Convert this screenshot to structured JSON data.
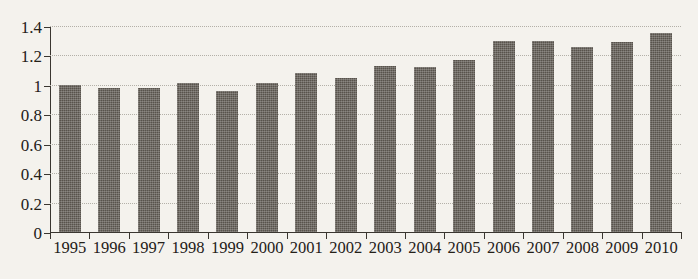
{
  "chart_data": {
    "type": "bar",
    "title": "",
    "subtitle": "",
    "xlabel": "",
    "ylabel": "",
    "categories": [
      "1995",
      "1996",
      "1997",
      "1998",
      "1999",
      "2000",
      "2001",
      "2002",
      "2003",
      "2004",
      "2005",
      "2006",
      "2007",
      "2008",
      "2009",
      "2010"
    ],
    "values": [
      1.0,
      0.98,
      0.98,
      1.01,
      0.96,
      1.01,
      1.08,
      1.05,
      1.13,
      1.12,
      1.17,
      1.3,
      1.3,
      1.26,
      1.29,
      1.35
    ],
    "series": [
      {
        "name": "",
        "values": [
          1.0,
          0.98,
          0.98,
          1.01,
          0.96,
          1.01,
          1.08,
          1.05,
          1.13,
          1.12,
          1.17,
          1.3,
          1.3,
          1.26,
          1.29,
          1.35
        ]
      }
    ],
    "ylim": [
      0,
      1.4
    ],
    "ytick_labels": [
      "0",
      "0.2",
      "0.4",
      "0.6",
      "0.8",
      "1",
      "1.2",
      "1.4"
    ],
    "ytick_values": [
      0,
      0.2,
      0.4,
      0.6,
      0.8,
      1.0,
      1.2,
      1.4
    ],
    "grid": true,
    "grid_style": "dotted-horizontal",
    "legend": false,
    "legend_position": "none",
    "annotations": [],
    "colors": {
      "bar": "#58534c",
      "background": "#f4f2ed",
      "axis": "#3a3630",
      "gridline": "#b3b0a8",
      "text": "#242018"
    }
  }
}
